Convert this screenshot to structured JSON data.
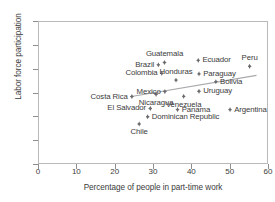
{
  "chart_data": {
    "type": "scatter",
    "title": "",
    "xlabel": "Percentage of people in part-time work",
    "ylabel": "Labor force participation",
    "xlim": [
      0,
      60
    ],
    "ylim": [
      20,
      80
    ],
    "xticks": [
      0,
      10,
      20,
      30,
      40,
      50,
      60
    ],
    "yticks": [
      20,
      30,
      40,
      50,
      60,
      70,
      80
    ],
    "grid": false,
    "legend": "none",
    "has_trendline": true,
    "trendline": {
      "x1": 24.0,
      "y1": 48.2,
      "x2": 57.0,
      "y2": 57.2
    },
    "points": [
      {
        "label": "Guatemala",
        "x": 33.0,
        "y": 62.6,
        "label_pos": "above"
      },
      {
        "label": "Brazil",
        "x": 31.4,
        "y": 61.6,
        "label_pos": "left"
      },
      {
        "label": "Colombia",
        "x": 32.3,
        "y": 58.0,
        "label_pos": "left"
      },
      {
        "label": "Honduras",
        "x": 36.0,
        "y": 55.2,
        "label_pos": "above"
      },
      {
        "label": "Mexico",
        "x": 33.1,
        "y": 50.4,
        "label_pos": "left"
      },
      {
        "label": "Costa Rica",
        "x": 24.5,
        "y": 48.3,
        "label_pos": "left"
      },
      {
        "label": "Nicaragua",
        "x": 30.8,
        "y": 49.2,
        "label_pos": "below"
      },
      {
        "label": "El Salvador",
        "x": 29.3,
        "y": 43.3,
        "label_pos": "left"
      },
      {
        "label": "Dominican Republic",
        "x": 28.6,
        "y": 39.8,
        "label_pos": "right"
      },
      {
        "label": "Chile",
        "x": 26.4,
        "y": 36.8,
        "label_pos": "below"
      },
      {
        "label": "Panama",
        "x": 36.4,
        "y": 42.8,
        "label_pos": "right"
      },
      {
        "label": "Venezuela",
        "x": 38.0,
        "y": 48.4,
        "label_pos": "below"
      },
      {
        "label": "Uruguay",
        "x": 42.0,
        "y": 50.5,
        "label_pos": "right"
      },
      {
        "label": "Paraguay",
        "x": 42.0,
        "y": 57.8,
        "label_pos": "right"
      },
      {
        "label": "Ecuador",
        "x": 41.8,
        "y": 63.5,
        "label_pos": "right"
      },
      {
        "label": "Bolivia",
        "x": 46.4,
        "y": 54.5,
        "label_pos": "right"
      },
      {
        "label": "Argentina",
        "x": 50.1,
        "y": 42.8,
        "label_pos": "right"
      },
      {
        "label": "Peru",
        "x": 55.2,
        "y": 61.0,
        "label_pos": "above"
      }
    ]
  },
  "style": {
    "marker_color": "#6b6b6e",
    "text_color": "#3b3b3b",
    "frame_color": "#b9b9bb",
    "trend_color": "#a9a9ad",
    "background": "#ffffff"
  }
}
